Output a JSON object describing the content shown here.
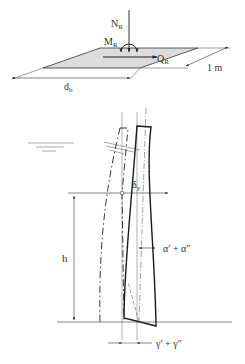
{
  "figure": {
    "top_panel": {
      "labels": {
        "normal_force": "N",
        "normal_force_sub": "R",
        "moment": "M",
        "moment_sub": "R",
        "shear_force": "Q",
        "shear_force_sub": "R",
        "width": "d",
        "width_sub": "b",
        "unit_depth": "1 m"
      }
    },
    "bottom_panel": {
      "labels": {
        "displacement": "δ",
        "displacement_sub": "y",
        "height": "h",
        "rotation": "α′ + α″",
        "base_rotation": "γ′ + γ″"
      }
    },
    "colors": {
      "line": "#1a1a1a",
      "thin_line": "#555555",
      "plate_fill": "#d9d9d9"
    }
  }
}
